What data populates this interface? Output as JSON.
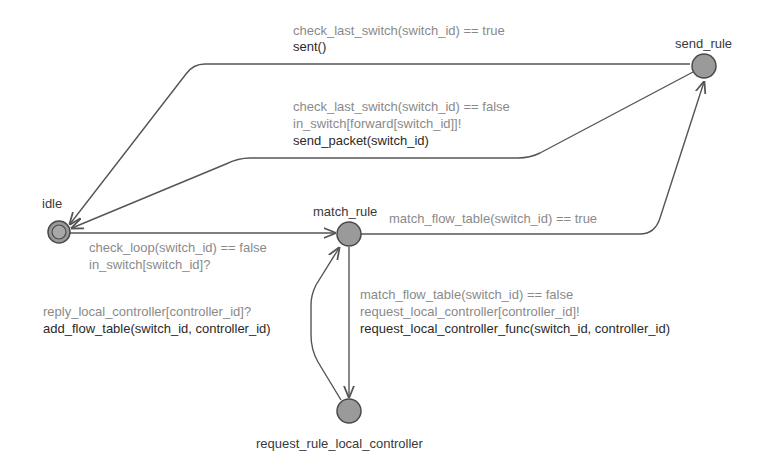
{
  "diagram": {
    "type": "state-machine (timed automaton)",
    "colors": {
      "edge": "#555555",
      "node_fill": "#9a9a9a",
      "node_stroke": "#4a4a4a",
      "guard_text": "#8a8a8a",
      "update_text": "#2a2a2a",
      "name_text": "#3a3a3a"
    },
    "locations": [
      {
        "id": "idle",
        "name": "idle",
        "initial": true
      },
      {
        "id": "send_rule",
        "name": "send_rule"
      },
      {
        "id": "match_rule",
        "name": "match_rule"
      },
      {
        "id": "request_rule_local_controller",
        "name": "request_rule_local_controller"
      }
    ],
    "edges": [
      {
        "from": "send_rule",
        "to": "idle",
        "guard": "check_last_switch(switch_id) == true",
        "update": "sent()"
      },
      {
        "from": "send_rule",
        "to": "idle",
        "guard": "check_last_switch(switch_id) == false",
        "sync": "in_switch[forward[switch_id]]!",
        "update": "send_packet(switch_id)"
      },
      {
        "from": "idle",
        "to": "match_rule",
        "guard": "check_loop(switch_id) == false",
        "sync": "in_switch[switch_id]?"
      },
      {
        "from": "match_rule",
        "to": "send_rule",
        "guard": "match_flow_table(switch_id) == true"
      },
      {
        "from": "match_rule",
        "to": "request_rule_local_controller",
        "guard": "match_flow_table(switch_id) == false",
        "sync": "request_local_controller[controller_id]!",
        "update": "request_local_controller_func(switch_id, controller_id)"
      },
      {
        "from": "request_rule_local_controller",
        "to": "match_rule",
        "sync": "reply_local_controller[controller_id]?",
        "update": "add_flow_table(switch_id, controller_id)"
      }
    ]
  }
}
